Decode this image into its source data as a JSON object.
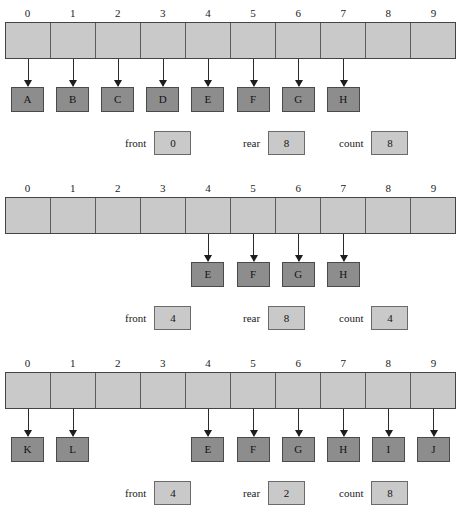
{
  "figure": {
    "colors": {
      "array_cell_fill": "#c9c9c9",
      "array_cell_border": "#5c5c5c",
      "data_box_fill": "#8d8d8d",
      "data_box_border": "#4a4a4a",
      "status_box_fill": "#c9c9c9",
      "arrow": "#1d1d1d",
      "background": "#ffffff",
      "text": "#141414"
    },
    "indices": [
      "0",
      "1",
      "2",
      "3",
      "4",
      "5",
      "6",
      "7",
      "8",
      "9"
    ],
    "array_size": 10
  },
  "diagrams": [
    {
      "name": "queue-state-initial",
      "indices": [
        "0",
        "1",
        "2",
        "3",
        "4",
        "5",
        "6",
        "7",
        "8",
        "9"
      ],
      "elements": [
        {
          "index": 0,
          "label": "A"
        },
        {
          "index": 1,
          "label": "B"
        },
        {
          "index": 2,
          "label": "C"
        },
        {
          "index": 3,
          "label": "D"
        },
        {
          "index": 4,
          "label": "E"
        },
        {
          "index": 5,
          "label": "F"
        },
        {
          "index": 6,
          "label": "G"
        },
        {
          "index": 7,
          "label": "H"
        }
      ],
      "status": {
        "front_label": "front",
        "front_value": "0",
        "rear_label": "rear",
        "rear_value": "8",
        "count_label": "count",
        "count_value": "8"
      }
    },
    {
      "name": "queue-state-after-dequeues",
      "indices": [
        "0",
        "1",
        "2",
        "3",
        "4",
        "5",
        "6",
        "7",
        "8",
        "9"
      ],
      "elements": [
        {
          "index": 4,
          "label": "E"
        },
        {
          "index": 5,
          "label": "F"
        },
        {
          "index": 6,
          "label": "G"
        },
        {
          "index": 7,
          "label": "H"
        }
      ],
      "status": {
        "front_label": "front",
        "front_value": "4",
        "rear_label": "rear",
        "rear_value": "8",
        "count_label": "count",
        "count_value": "4"
      }
    },
    {
      "name": "queue-state-wrapped",
      "indices": [
        "0",
        "1",
        "2",
        "3",
        "4",
        "5",
        "6",
        "7",
        "8",
        "9"
      ],
      "elements": [
        {
          "index": 0,
          "label": "K"
        },
        {
          "index": 1,
          "label": "L"
        },
        {
          "index": 4,
          "label": "E"
        },
        {
          "index": 5,
          "label": "F"
        },
        {
          "index": 6,
          "label": "G"
        },
        {
          "index": 7,
          "label": "H"
        },
        {
          "index": 8,
          "label": "I"
        },
        {
          "index": 9,
          "label": "J"
        }
      ],
      "status": {
        "front_label": "front",
        "front_value": "4",
        "rear_label": "rear",
        "rear_value": "2",
        "count_label": "count",
        "count_value": "8"
      }
    }
  ]
}
